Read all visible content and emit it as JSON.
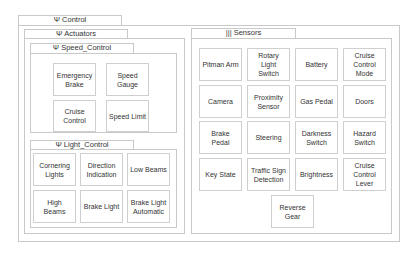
{
  "control": {
    "title": "Ψ Control",
    "actuators": {
      "title": "Ψ Actuators",
      "speed_control": {
        "title": "Ψ Speed_Control",
        "items": [
          "Emergency Brake",
          "Speed Gauge",
          "Cruise Control",
          "Speed Limit"
        ]
      },
      "light_control": {
        "title": "Ψ Light_Control",
        "items": [
          "Cornering Lights",
          "Direction Indication",
          "Low Beams",
          "High Beams",
          "Brake Light",
          "Brake Light Automatic"
        ]
      }
    },
    "sensors": {
      "title": "||| Sensors",
      "items": [
        "Pitman Arm",
        "Rotary Light Switch",
        "Battery",
        "Cruise Control Mode",
        "Camera",
        "Proximity Sensor",
        "Gas Pedal",
        "Doors",
        "Brake Pedal",
        "Steering",
        "Darkness Switch",
        "Hazard Switch",
        "Key State",
        "Traffic Sign Detection",
        "Brightness",
        "Cruise Control Lever",
        "Reverse Gear"
      ]
    }
  }
}
